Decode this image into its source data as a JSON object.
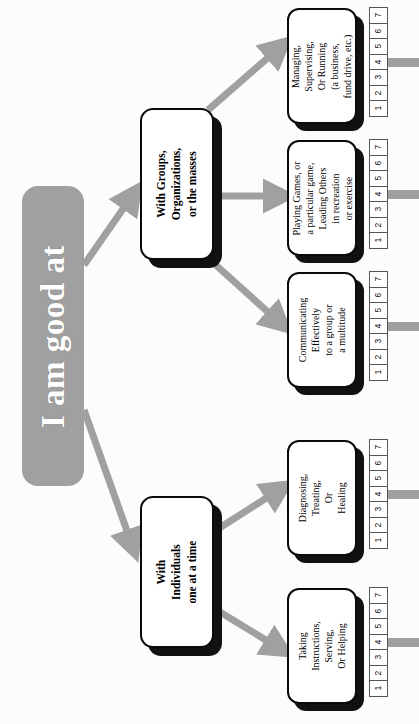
{
  "diagram": {
    "title": "I am good at",
    "type": "hierarchy-tree",
    "orientation": "rotated-90-ccw",
    "colors": {
      "root_fill": "#a0a0a0",
      "root_text": "#ffffff",
      "node_fill": "#ffffff",
      "node_border": "#0a0a0a",
      "node_shadow": "#111111",
      "arrow": "#a0a0a0",
      "scale_border": "#555555"
    },
    "root": {
      "label": "I am good at"
    },
    "categories": [
      {
        "id": "groups",
        "label": "With Groups,\nOrganizations,\nor the masses",
        "lines": [
          "With Groups,",
          "Organizations,",
          "or the masses"
        ]
      },
      {
        "id": "individuals",
        "label": "With\nIndividuals\none at a time",
        "lines": [
          "With",
          "Individuals",
          "one at a time"
        ]
      }
    ],
    "leaves": [
      {
        "id": "managing",
        "parent": "groups",
        "lines": [
          "Managing,",
          "Supervising,",
          "Or Running",
          "(a business,",
          "fund drive, etc.)"
        ]
      },
      {
        "id": "playing",
        "parent": "groups",
        "lines": [
          "Playing Games, or",
          "a particular game,",
          "Leading Others",
          "in recreation",
          "or exercise"
        ]
      },
      {
        "id": "communicating",
        "parent": "groups",
        "lines": [
          "Communicating",
          "Effectively",
          "to a group or",
          "a multitude"
        ]
      },
      {
        "id": "diagnosing",
        "parent": "individuals",
        "lines": [
          "Diagnosing,",
          "Treating,",
          "Or",
          "Healing"
        ]
      },
      {
        "id": "taking",
        "parent": "individuals",
        "lines": [
          "Taking",
          "Instructions,",
          "Serving,",
          "Or Helping"
        ]
      }
    ],
    "scale": {
      "values": [
        "1",
        "2",
        "3",
        "4",
        "5",
        "6",
        "7"
      ],
      "min": 1,
      "max": 7,
      "connector_at": "4"
    }
  }
}
